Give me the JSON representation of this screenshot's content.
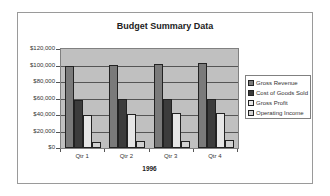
{
  "chart_data": {
    "type": "bar",
    "title": "Budget Summary Data",
    "xlabel": "1996",
    "ylabel": "",
    "categories": [
      "Qtr 1",
      "Qtr 2",
      "Qtr 3",
      "Qtr 4"
    ],
    "series": [
      {
        "name": "Gross Revenue",
        "color": "#7a7a7a",
        "values": [
          100000,
          101000,
          102000,
          103000
        ]
      },
      {
        "name": "Cost of Goods Sold",
        "color": "#3c3c3c",
        "values": [
          58000,
          60000,
          60000,
          60000
        ]
      },
      {
        "name": "Gross Profit",
        "color": "#e6e6e6",
        "values": [
          40000,
          41000,
          42000,
          43000
        ]
      },
      {
        "name": "Operating Income",
        "color": "#d2d2d2",
        "values": [
          7000,
          8000,
          9000,
          10000
        ]
      }
    ],
    "ylim": [
      0,
      120000
    ],
    "yticks": [
      "$0",
      "$20,000",
      "$40,000",
      "$60,000",
      "$80,000",
      "$100,000",
      "$120,000"
    ],
    "grid": true,
    "legend_position": "right"
  }
}
